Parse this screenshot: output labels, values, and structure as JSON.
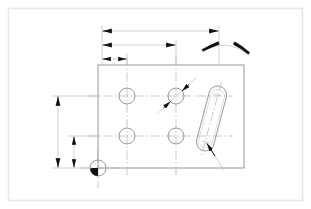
{
  "document": {
    "title": "Engineering Part Drawing",
    "type": "2D CAD technical drawing",
    "projection": "front view",
    "background_color": "#ffffff",
    "sheet_border_color": "#e8e8e8",
    "line_color": "#808080",
    "centerline_color": "#a8a8a8",
    "dimension_color": "#999999",
    "arrow_color": "#111111"
  },
  "sheet": {
    "border": {
      "x": 8,
      "y": 8,
      "width": 295,
      "height": 193
    }
  },
  "part": {
    "name": "rectangular-plate",
    "outline": {
      "x": 98,
      "y": 65,
      "width": 146,
      "height": 103
    },
    "edges": [
      "top",
      "right",
      "bottom",
      "left"
    ]
  },
  "features": {
    "holes": [
      {
        "id": "hole-top-left",
        "cx": 127,
        "cy": 96,
        "r": 8,
        "label": "hole"
      },
      {
        "id": "hole-top-right",
        "cx": 176,
        "cy": 96,
        "r": 8,
        "label": "hole"
      },
      {
        "id": "hole-bottom-left",
        "cx": 127,
        "cy": 136,
        "r": 8,
        "label": "hole"
      },
      {
        "id": "hole-bottom-right",
        "cx": 176,
        "cy": 136,
        "r": 8,
        "label": "hole"
      }
    ],
    "slot": {
      "id": "slot-obround",
      "x1": 218,
      "y1": 94,
      "x2": 205,
      "y2": 143,
      "radius": 9,
      "angle_deg": 15,
      "label": "elongated slot"
    },
    "datum": {
      "id": "datum-origin-marker",
      "cx": 98,
      "cy": 168,
      "r": 8,
      "filled_quadrant": "lower-left",
      "label": "origin datum"
    }
  },
  "centerlines": {
    "horizontal": [
      {
        "y": 96,
        "x1": 88,
        "x2": 232
      },
      {
        "y": 136,
        "x1": 88,
        "x2": 232
      }
    ],
    "vertical": [
      {
        "x": 127,
        "y1": 56,
        "y2": 178
      },
      {
        "x": 176,
        "y1": 56,
        "y2": 178
      },
      {
        "x": 98,
        "y1": 150,
        "y2": 186
      }
    ],
    "slot_axis": {
      "x1": 221,
      "y1": 84,
      "x2": 202,
      "y2": 153
    }
  },
  "dimensions": {
    "horizontal": [
      {
        "id": "dim-overall-width",
        "y": 31,
        "from_x": 102,
        "to_x": 219,
        "arrows": "both-inward",
        "extension_from_x": 102,
        "extension_to_x": 219,
        "label": "overall width"
      },
      {
        "id": "dim-hole-column-spacing",
        "y": 45,
        "from_x": 102,
        "to_x": 176,
        "arrows": "both-inward",
        "label": "hole column spacing"
      },
      {
        "id": "dim-edge-to-first-hole",
        "y": 59,
        "from_x": 102,
        "to_x": 127,
        "arrows": "both-inward",
        "label": "edge to first hole"
      }
    ],
    "vertical": [
      {
        "id": "dim-overall-height",
        "x": 58,
        "from_y": 96,
        "to_y": 168,
        "arrows": "both-inward",
        "label": "overall height"
      },
      {
        "id": "dim-lower-hole-height",
        "x": 74,
        "from_y": 136,
        "to_y": 168,
        "arrows": "both-inward",
        "label": "lower hole height"
      }
    ],
    "extension_lines": {
      "horizontal_from_left_edge": [
        {
          "y": 96,
          "x1": 53,
          "x2": 98
        },
        {
          "y": 136,
          "x1": 69,
          "x2": 98
        },
        {
          "y": 168,
          "x1": 53,
          "x2": 98
        }
      ],
      "vertical_up": [
        {
          "x": 102,
          "y1": 26,
          "y2": 65
        },
        {
          "x": 127,
          "y1": 54,
          "y2": 65
        },
        {
          "x": 176,
          "y1": 40,
          "y2": 65
        },
        {
          "x": 219,
          "y1": 26,
          "y2": 65
        }
      ]
    },
    "diameter": {
      "id": "dim-hole-diameter",
      "target": "hole-top-right",
      "leader_x1": 157,
      "leader_y1": 113,
      "leader_x2": 196,
      "leader_y2": 78,
      "arrows": "both-inward-45deg",
      "label": "hole diameter"
    },
    "angular": {
      "id": "dim-slot-angle",
      "arc_start_x": 203,
      "arc_start_y": 52,
      "arc_end_x": 248,
      "arc_end_y": 55,
      "arc_peak_x": 226,
      "arc_peak_y": 42,
      "arrows": "both-ends",
      "label": "slot angle"
    },
    "slot_leader": {
      "id": "dim-slot-leader",
      "x1": 223,
      "y1": 168,
      "x2": 207,
      "y2": 143,
      "arrow": "at-slot-end",
      "label": "slot position leader"
    }
  }
}
